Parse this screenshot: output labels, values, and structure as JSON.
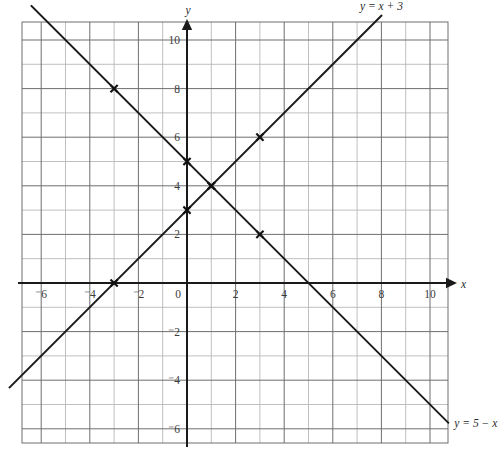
{
  "chart_data": {
    "type": "line",
    "title": "",
    "xlabel": "x",
    "ylabel": "y",
    "xlim": [
      -6.8,
      10.7
    ],
    "ylim": [
      -6.6,
      10.7
    ],
    "grid": true,
    "minor_grid_step": 1,
    "major_grid_step": 2,
    "legend_position": "inline-end-of-line",
    "x_ticks": [
      {
        "value": -6,
        "label": "⁻6"
      },
      {
        "value": -4,
        "label": "⁻4"
      },
      {
        "value": -2,
        "label": "⁻2"
      },
      {
        "value": 0,
        "label": "0"
      },
      {
        "value": 2,
        "label": "2"
      },
      {
        "value": 4,
        "label": "4"
      },
      {
        "value": 6,
        "label": "6"
      },
      {
        "value": 8,
        "label": "8"
      },
      {
        "value": 10,
        "label": "10"
      }
    ],
    "y_ticks": [
      {
        "value": 10,
        "label": "10"
      },
      {
        "value": 8,
        "label": "8"
      },
      {
        "value": 6,
        "label": "6"
      },
      {
        "value": 4,
        "label": "4"
      },
      {
        "value": 2,
        "label": "2"
      },
      {
        "value": -2,
        "label": "⁻2"
      },
      {
        "value": -4,
        "label": "⁻4"
      },
      {
        "value": -6,
        "label": "⁻6"
      }
    ],
    "series": [
      {
        "name": "y = x + 3",
        "label": "y = x + 3",
        "equation": "y = x + 3",
        "slope": 1,
        "intercept": 3,
        "x_from": -7.3,
        "x_to": 8.0,
        "label_x": 8.0,
        "label_y": 11.4,
        "label_anchor": "middle",
        "marked_points": [
          {
            "x": -3,
            "y": 0
          },
          {
            "x": 0,
            "y": 3
          },
          {
            "x": 1,
            "y": 4
          },
          {
            "x": 3,
            "y": 6
          }
        ]
      },
      {
        "name": "y = 5 - x",
        "label": "y = 5 − x",
        "equation": "y = 5 − x",
        "slope": -1,
        "intercept": 5,
        "x_from": -6.4,
        "x_to": 10.75,
        "label_x": 11.0,
        "label_y": -5.75,
        "label_anchor": "start",
        "marked_points": [
          {
            "x": -3,
            "y": 8
          },
          {
            "x": 0,
            "y": 5
          },
          {
            "x": 1,
            "y": 4
          },
          {
            "x": 3,
            "y": 2
          }
        ]
      }
    ],
    "intersection": {
      "x": 1,
      "y": 4
    },
    "axis_labels": {
      "x": "x",
      "y": "y"
    },
    "colors": {
      "line": "#1a1a1a",
      "axis": "#1a1a1a",
      "major_grid": "#6f6f6f",
      "minor_grid": "#b9b9b9",
      "tick_text": "#3b3b3b",
      "background": "#ffffff"
    }
  }
}
